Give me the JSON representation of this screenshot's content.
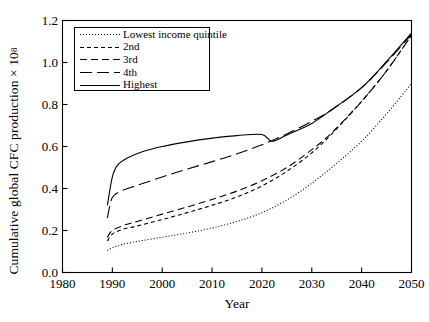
{
  "chart_data": {
    "type": "line",
    "title": "",
    "xlabel": "Year",
    "ylabel_text": "Cumulative global CFC production × 10",
    "ylabel_exponent": "8",
    "xlim": [
      1980,
      2050
    ],
    "ylim": [
      0.0,
      1.2
    ],
    "xticks": [
      1980,
      1990,
      2000,
      2010,
      2020,
      2030,
      2040,
      2050
    ],
    "xtick_labels": [
      "1980",
      "1990",
      "2000",
      "2010",
      "2020",
      "2030",
      "2040",
      "2050"
    ],
    "yticks": [
      0.0,
      0.2,
      0.4,
      0.6,
      0.8,
      1.0,
      1.2
    ],
    "ytick_labels": [
      "0.0",
      "0.2",
      "0.4",
      "0.6",
      "0.8",
      "1.0",
      "1.2"
    ],
    "grid": false,
    "legend_position": "upper-left-inside",
    "line_color": "#000000",
    "series": [
      {
        "name": "Lowest income quintile",
        "dash": "dotted",
        "dasharray": "1,2",
        "x": [
          1989,
          1990,
          1992,
          1995,
          2000,
          2005,
          2010,
          2015,
          2020,
          2025,
          2030,
          2035,
          2040,
          2045,
          2050
        ],
        "y": [
          0.105,
          0.118,
          0.133,
          0.148,
          0.168,
          0.188,
          0.212,
          0.243,
          0.285,
          0.345,
          0.425,
          0.52,
          0.625,
          0.755,
          0.9
        ]
      },
      {
        "name": "2nd",
        "dash": "short-dashed",
        "dasharray": "4,3",
        "x": [
          1989,
          1990,
          1992,
          1995,
          2000,
          2005,
          2010,
          2015,
          2020,
          2025,
          2030,
          2034,
          2040,
          2045,
          2050
        ],
        "y": [
          0.15,
          0.183,
          0.205,
          0.222,
          0.252,
          0.285,
          0.32,
          0.36,
          0.412,
          0.482,
          0.57,
          0.66,
          0.815,
          0.96,
          1.13
        ]
      },
      {
        "name": "3rd",
        "dash": "medium-dashed",
        "dasharray": "7,4",
        "x": [
          1989,
          1990,
          1992,
          1995,
          2000,
          2005,
          2010,
          2015,
          2020,
          2025,
          2030,
          2034,
          2040,
          2045,
          2050
        ],
        "y": [
          0.168,
          0.2,
          0.222,
          0.243,
          0.278,
          0.312,
          0.348,
          0.388,
          0.437,
          0.5,
          0.585,
          0.665,
          0.815,
          0.96,
          1.13
        ]
      },
      {
        "name": "4th",
        "dash": "long-dashed",
        "dasharray": "12,5",
        "x": [
          1989,
          1990,
          1992,
          1995,
          2000,
          2005,
          2010,
          2015,
          2020,
          2025,
          2030,
          2034,
          2040,
          2045,
          2050
        ],
        "y": [
          0.26,
          0.357,
          0.39,
          0.415,
          0.455,
          0.492,
          0.528,
          0.565,
          0.608,
          0.66,
          0.72,
          0.775,
          0.88,
          1.0,
          1.135
        ]
      },
      {
        "name": "Highest",
        "dash": "solid",
        "dasharray": "",
        "x": [
          1989,
          1990,
          1991,
          1993,
          1996,
          2000,
          2005,
          2010,
          2015,
          2020,
          2022,
          2025,
          2030,
          2034,
          2040,
          2045,
          2050
        ],
        "y": [
          0.32,
          0.455,
          0.51,
          0.545,
          0.575,
          0.6,
          0.622,
          0.64,
          0.652,
          0.657,
          0.625,
          0.655,
          0.71,
          0.775,
          0.88,
          1.005,
          1.14
        ]
      }
    ],
    "legend_entries": [
      {
        "label": "Lowest income quintile",
        "dasharray": "1,2"
      },
      {
        "label": "2nd",
        "dasharray": "4,3"
      },
      {
        "label": "3rd",
        "dasharray": "7,4"
      },
      {
        "label": "4th",
        "dasharray": "12,5"
      },
      {
        "label": "Highest",
        "dasharray": ""
      }
    ]
  }
}
